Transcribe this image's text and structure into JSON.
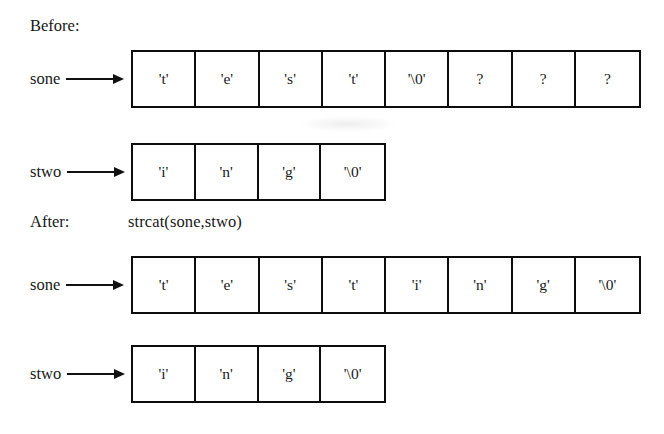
{
  "diagram": {
    "title": "strcat(sone,stwo)",
    "before": {
      "label": "Before:",
      "rows": [
        {
          "pointer": "sone",
          "cells": [
            "'t'",
            "'e'",
            "'s'",
            "'t'",
            "'\\0'",
            "?",
            "?",
            "?"
          ]
        },
        {
          "pointer": "stwo",
          "cells": [
            "'i'",
            "'n'",
            "'g'",
            "'\\0'"
          ]
        }
      ]
    },
    "after": {
      "label": "After:",
      "operation": "strcat(sone,stwo)",
      "rows": [
        {
          "pointer": "sone",
          "cells": [
            "'t'",
            "'e'",
            "'s'",
            "'t'",
            "'i'",
            "'n'",
            "'g'",
            "'\\0'"
          ]
        },
        {
          "pointer": "stwo",
          "cells": [
            "'i'",
            "'n'",
            "'g'",
            "'\\0'"
          ]
        }
      ]
    },
    "colors": {
      "ink": "#111111",
      "paper": "#ffffff",
      "border": "#0d0d0d"
    }
  }
}
